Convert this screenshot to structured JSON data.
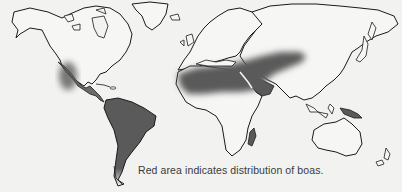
{
  "map": {
    "title": "Distribution of boas",
    "caption": "Red area indicates distribution of boas.",
    "colors": {
      "background": "#f2f2f0",
      "coastline": "#1a1a1a",
      "land": "#f6f6f4",
      "distribution_shade": "#5a5a5a"
    },
    "regions_shaded": [
      "Mexico (Pacific coast)",
      "Central America",
      "South America (northern and central)",
      "North Africa",
      "Middle East / Arabia",
      "Central Asia",
      "Madagascar",
      "New Guinea"
    ]
  }
}
